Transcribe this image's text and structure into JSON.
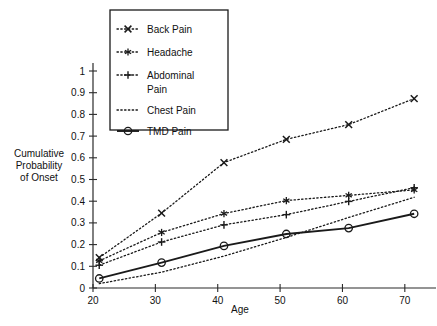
{
  "chart_data": {
    "type": "line",
    "title": "",
    "xlabel": "Age",
    "ylabel": "Cumulative\nProbability\nof Onset",
    "x": [
      21,
      31,
      41,
      51,
      61,
      71.5
    ],
    "xlim": [
      20,
      75
    ],
    "ylim": [
      0,
      1
    ],
    "xticks": [
      20,
      30,
      40,
      50,
      60,
      70
    ],
    "yticks": [
      0,
      0.1,
      0.2,
      0.3,
      0.4,
      0.5,
      0.6,
      0.7,
      0.8,
      0.9,
      1
    ],
    "xtick_labels": [
      "20",
      "30",
      "40",
      "50",
      "60",
      "70"
    ],
    "ytick_labels": [
      "0",
      "0.1",
      "0.2",
      "0.3",
      "0.4",
      "0.5",
      "0.6",
      "0.7",
      "0.8",
      "0.9",
      "1"
    ],
    "grid": false,
    "legend_position": "top-left",
    "series": [
      {
        "name": "Back Pain",
        "marker": "x",
        "linestyle": "dotted",
        "color": "#1a1a1a",
        "values": [
          0.14,
          0.345,
          0.578,
          0.685,
          0.753,
          0.873
        ]
      },
      {
        "name": "Headache",
        "marker": "star",
        "linestyle": "dotted",
        "color": "#1a1a1a",
        "values": [
          0.125,
          0.256,
          0.343,
          0.403,
          0.427,
          0.452
        ]
      },
      {
        "name": "Abdominal Pain",
        "marker": "plus",
        "linestyle": "dotted",
        "color": "#1a1a1a",
        "values": [
          0.105,
          0.212,
          0.291,
          0.338,
          0.399,
          0.462
        ]
      },
      {
        "name": "Chest Pain",
        "marker": "none",
        "linestyle": "dotted",
        "color": "#1a1a1a",
        "values": [
          0.02,
          0.073,
          0.147,
          0.233,
          0.325,
          0.418
        ]
      },
      {
        "name": "TMD Pain",
        "marker": "circle",
        "linestyle": "solid",
        "color": "#1a1a1a",
        "values": [
          0.044,
          0.117,
          0.194,
          0.249,
          0.276,
          0.342
        ]
      }
    ]
  },
  "legend": {
    "entries": [
      {
        "label": "Back Pain"
      },
      {
        "label": "Headache"
      },
      {
        "label": "Abdominal"
      },
      {
        "label": "Pain"
      },
      {
        "label": "Chest Pain"
      },
      {
        "label": "TMD Pain"
      }
    ]
  },
  "axes": {
    "x_title": "Age",
    "y_title_line1": "Cumulative",
    "y_title_line2": "Probability",
    "y_title_line3": "of Onset"
  }
}
